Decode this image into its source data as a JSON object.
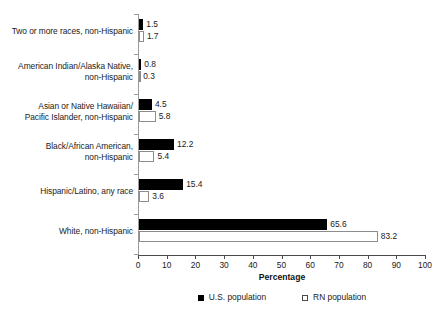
{
  "chart_data": {
    "type": "bar",
    "orientation": "horizontal",
    "title": "",
    "xlabel": "Percentage",
    "ylabel": "",
    "xlim": [
      0,
      100
    ],
    "xticks": [
      0,
      10,
      20,
      30,
      40,
      50,
      60,
      70,
      80,
      90,
      100
    ],
    "grid": false,
    "legend_position": "bottom-center",
    "categories": [
      "Two or more races, non-Hispanic",
      "American Indian/Alaska Native, non-Hispanic",
      "Asian or Native Hawaiian/ Pacific Islander, non-Hispanic",
      "Black/African American, non-Hispanic",
      "Hispanic/Latino, any race",
      "White, non-Hispanic"
    ],
    "category_lines": [
      [
        "Two or more races, non-Hispanic"
      ],
      [
        "American Indian/Alaska Native,",
        "non-Hispanic"
      ],
      [
        "Asian or Native Hawaiian/",
        "Pacific Islander, non-Hispanic"
      ],
      [
        "Black/African American,",
        "non-Hispanic"
      ],
      [
        "Hispanic/Latino, any race"
      ],
      [
        "White, non-Hispanic"
      ]
    ],
    "series": [
      {
        "name": "U.S. population",
        "marker": "filled-square",
        "color": "#000000",
        "values": [
          1.5,
          0.8,
          4.5,
          12.2,
          15.4,
          65.6
        ],
        "labels": [
          "1.5",
          "0.8",
          "4.5",
          "12.2",
          "15.4",
          "65.6"
        ]
      },
      {
        "name": "RN population",
        "marker": "open-square",
        "color": "#ffffff",
        "values": [
          1.7,
          0.3,
          5.8,
          5.4,
          3.6,
          83.2
        ],
        "labels": [
          "1.7",
          "0.3",
          "5.8",
          "5.4",
          "3.6",
          "83.2"
        ]
      }
    ]
  },
  "axis": {
    "x_title": "Percentage",
    "tick_labels": [
      "0",
      "10",
      "20",
      "30",
      "40",
      "50",
      "60",
      "70",
      "80",
      "90",
      "100"
    ]
  },
  "legend": {
    "items": [
      {
        "label": "U.S. population",
        "marker": "filled-square"
      },
      {
        "label": "RN population",
        "marker": "open-square"
      }
    ]
  }
}
